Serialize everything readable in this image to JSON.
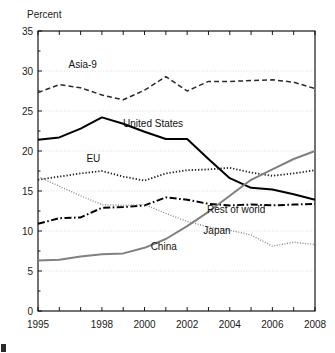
{
  "chart_data": {
    "type": "line",
    "title": "",
    "ylabel": "Percent",
    "xlabel": "",
    "ylim": [
      0,
      35
    ],
    "xlim": [
      1995,
      2008
    ],
    "yticks": [
      0,
      5,
      10,
      15,
      20,
      25,
      30,
      35
    ],
    "ytick_labels": [
      "0",
      "5",
      "10",
      "15",
      "20",
      "25",
      "30",
      "35"
    ],
    "xticks": [
      1995,
      1996,
      1997,
      1998,
      1999,
      2000,
      2001,
      2002,
      2003,
      2004,
      2005,
      2006,
      2007,
      2008
    ],
    "xtick_labels_shown": [
      "1995",
      "1998",
      "2000",
      "2002",
      "2004",
      "2006",
      "2008"
    ],
    "xtick_label_years": [
      1995,
      1998,
      2000,
      2002,
      2004,
      2006,
      2008
    ],
    "grid": true,
    "grid_axis": "y",
    "legend_position": "inline-annotations",
    "x": [
      1995,
      1996,
      1997,
      1998,
      1999,
      2000,
      2001,
      2002,
      2003,
      2004,
      2005,
      2006,
      2007,
      2008
    ],
    "series": [
      {
        "name": "Asia-9",
        "style": "dashed",
        "color": "#2b2b2b",
        "width": 1.5,
        "dash": "5 3",
        "label_x": 1997.1,
        "label_y": 30.4,
        "values": [
          27.3,
          28.3,
          27.9,
          27.0,
          26.4,
          27.6,
          29.3,
          27.5,
          28.7,
          28.7,
          28.8,
          28.9,
          28.6,
          27.8
        ]
      },
      {
        "name": "United States",
        "style": "solid",
        "color": "#000000",
        "width": 2.0,
        "dash": "none",
        "label_x": 2000.4,
        "label_y": 23.0,
        "values": [
          21.4,
          21.7,
          22.8,
          24.2,
          23.4,
          22.4,
          21.5,
          21.5,
          19.0,
          16.6,
          15.4,
          15.2,
          14.6,
          13.9
        ]
      },
      {
        "name": "EU",
        "style": "dotted",
        "color": "#1f1f1f",
        "width": 1.8,
        "dash": "1.3 1.9",
        "label_x": 1997.6,
        "label_y": 18.6,
        "values": [
          16.4,
          16.8,
          17.2,
          17.5,
          16.8,
          16.3,
          17.2,
          17.6,
          17.7,
          17.9,
          17.3,
          16.9,
          17.2,
          17.6
        ]
      },
      {
        "name": "Rest of world",
        "style": "dash-dot",
        "color": "#000000",
        "width": 2.0,
        "dash": "7 2.5 1.6 2.5",
        "label_x": 2004.3,
        "label_y": 12.3,
        "values": [
          10.9,
          11.6,
          11.7,
          12.9,
          13.0,
          13.2,
          14.2,
          13.9,
          13.4,
          13.2,
          13.3,
          13.2,
          13.3,
          13.4
        ]
      },
      {
        "name": "China",
        "style": "solid",
        "color": "#808080",
        "width": 2.0,
        "dash": "none",
        "label_x": 2000.9,
        "label_y": 7.6,
        "values": [
          6.3,
          6.4,
          6.8,
          7.1,
          7.2,
          7.9,
          9.0,
          10.6,
          12.4,
          14.4,
          16.4,
          17.7,
          19.0,
          20.0
        ]
      },
      {
        "name": "Japan",
        "style": "fine-dotted",
        "color": "#8a8a8a",
        "width": 1.4,
        "dash": "1 1.6",
        "label_x": 2003.4,
        "label_y": 9.6,
        "values": [
          16.8,
          15.6,
          14.4,
          13.3,
          13.2,
          13.3,
          12.2,
          11.2,
          10.5,
          10.1,
          9.5,
          8.1,
          8.6,
          8.3
        ]
      }
    ]
  },
  "plot": {
    "left": 38,
    "right": 315,
    "top": 31,
    "bottom": 311
  }
}
